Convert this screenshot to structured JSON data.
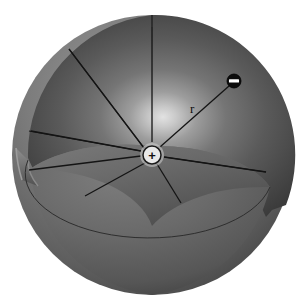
{
  "figure": {
    "background_color": "#ffffff",
    "width": 301,
    "height": 306
  },
  "sphere": {
    "name": "gaussian-sphere",
    "center": {
      "x": 152,
      "y": 155
    },
    "radius": 140,
    "outer_shell_color_light": "#8d8d8d",
    "outer_shell_color_mid": "#6f6f6f",
    "outer_shell_color_dark": "#4a4a4a",
    "inner_cavity_color_light": "#d6d6d6",
    "inner_cavity_color_mid": "#6a6a6a",
    "inner_cavity_color_dark": "#3f3f3f",
    "lower_bowl_color_light": "#7a7a7a",
    "lower_bowl_color_dark": "#4f4f4f",
    "rim_color": "#8a8a8a",
    "cut_edge_color": "#3a3a3a"
  },
  "charges": {
    "positive": {
      "label": "+",
      "name": "positive-charge",
      "x": 152,
      "y": 155,
      "radius": 9,
      "fill": "#e8e8e8",
      "stroke": "#1a1a1a",
      "symbol_color": "#111111"
    },
    "negative": {
      "label": "–",
      "name": "negative-charge",
      "x": 234,
      "y": 81,
      "radius": 7,
      "fill": "#0c0c0c",
      "stroke": "#000000",
      "symbol_color": "#ffffff"
    }
  },
  "labels": [
    {
      "id": "radius-label",
      "text": "r",
      "x": 190,
      "y": 113
    }
  ],
  "field_arrows": {
    "name": "electric-field-arrows",
    "color": "#141414",
    "stroke_width": 1.3,
    "head_length": 7,
    "head_width": 4.4,
    "description": "Radial arrows directed inward toward the central positive charge",
    "count": 9,
    "items": [
      {
        "id": "arrow-from-top",
        "x1": 152,
        "y1": 27,
        "x2": 152,
        "y2": 142
      },
      {
        "id": "arrow-from-upper-left",
        "x1": 69,
        "y1": 49,
        "x2": 144,
        "y2": 148
      },
      {
        "id": "arrow-from-left-upper",
        "x1": 31,
        "y1": 131,
        "x2": 141,
        "y2": 151
      },
      {
        "id": "arrow-from-left-lower",
        "x1": 29,
        "y1": 170,
        "x2": 141,
        "y2": 156
      },
      {
        "id": "arrow-from-lower-left",
        "x1": 85,
        "y1": 196,
        "x2": 145,
        "y2": 163
      },
      {
        "id": "arrow-from-bottom",
        "x1": 181,
        "y1": 203,
        "x2": 157,
        "y2": 164
      },
      {
        "id": "arrow-from-right",
        "x1": 266,
        "y1": 172,
        "x2": 164,
        "y2": 157
      },
      {
        "id": "arrow-from-upper-right",
        "x1": 229,
        "y1": 86,
        "x2": 160,
        "y2": 147
      }
    ]
  },
  "sector_lines": {
    "name": "cut-face-sector-lines",
    "color": "#141414",
    "stroke_width": 1.1,
    "items": [
      {
        "id": "sector-line-upper-left-long",
        "x1": 69,
        "y1": 49,
        "x2": 144,
        "y2": 148
      },
      {
        "id": "sector-line-left-rim",
        "x1": 29,
        "y1": 131,
        "x2": 141,
        "y2": 151
      },
      {
        "id": "sector-line-right-rim",
        "x1": 266,
        "y1": 172,
        "x2": 164,
        "y2": 157
      }
    ]
  }
}
